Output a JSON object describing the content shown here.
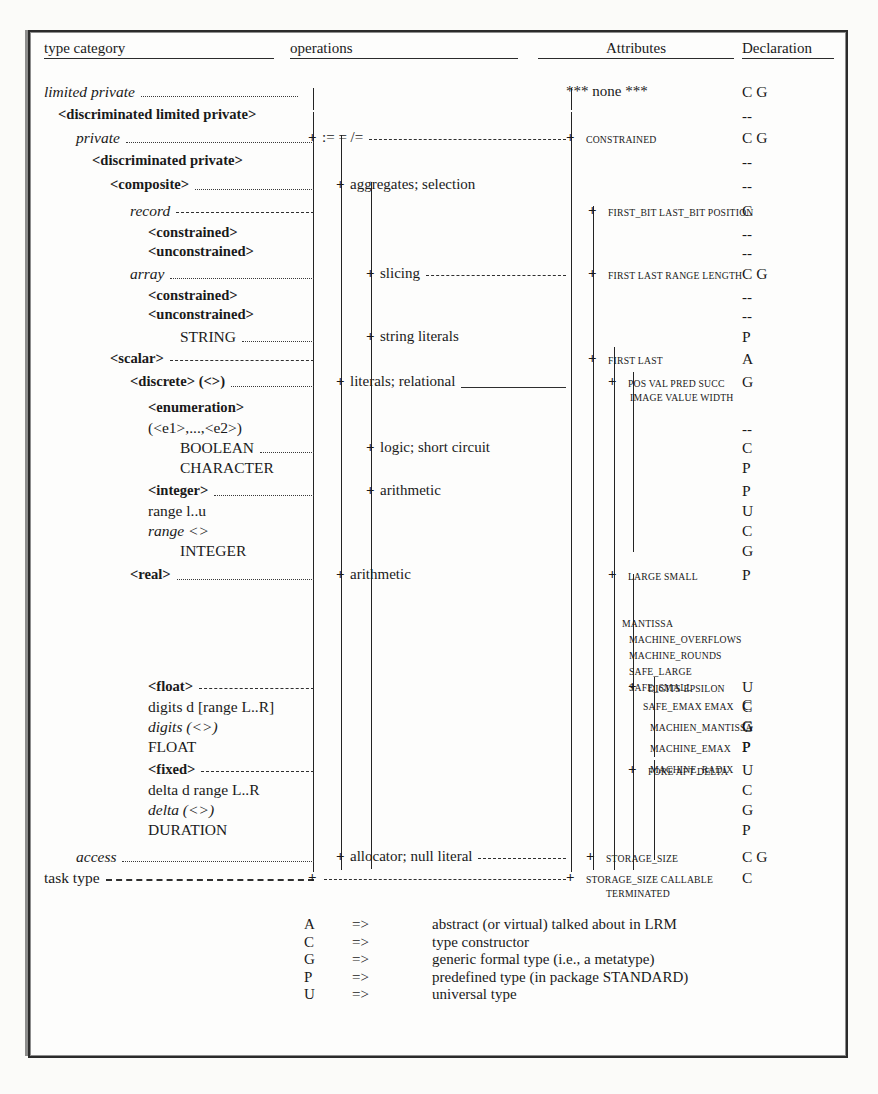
{
  "headers": {
    "type_category": "type category",
    "operations": "operations",
    "attributes": "Attributes",
    "declaration": "Declaration"
  },
  "rows": [
    {
      "category": "limited private",
      "style": "italic",
      "indent": 0,
      "leader": "dotted",
      "ops": "<basic operations>",
      "ops_plus": false,
      "attr": "*** none ***",
      "attr_plus": false,
      "attr_caps": false,
      "decl": "C G"
    },
    {
      "category": "<discriminated limited private>",
      "style": "bold",
      "indent": 1,
      "leader": "none",
      "ops": "",
      "ops_plus": false,
      "attr": "",
      "attr_plus": false,
      "decl": "--"
    },
    {
      "category": "private",
      "style": "italic",
      "indent": 2,
      "leader": "dotted",
      "ops": ":= = /=",
      "ops_plus": true,
      "ops_trail": "dashed",
      "attr": "CONSTRAINED",
      "attr_plus": true,
      "attr_caps": true,
      "decl": "C G"
    },
    {
      "category": "<discriminated private>",
      "style": "bold",
      "indent": 3,
      "leader": "none",
      "ops": "",
      "ops_plus": false,
      "attr": "",
      "attr_plus": false,
      "decl": "--"
    },
    {
      "category": "<composite>",
      "style": "bold",
      "indent": 4,
      "leader": "dotted",
      "ops": "aggregates; selection",
      "ops_plus": true,
      "attr": "",
      "attr_plus": false,
      "decl": "--"
    },
    {
      "category": "record",
      "style": "italic",
      "indent": 5,
      "leader": "dashed",
      "ops": "",
      "ops_plus": false,
      "ops_trail": "dashed",
      "attr": "FIRST_BIT LAST_BIT POSITION",
      "attr_plus": true,
      "attr_caps": true,
      "decl": "C"
    },
    {
      "category": "<constrained>",
      "style": "bold",
      "indent": 6,
      "leader": "none",
      "ops": "",
      "ops_plus": false,
      "attr": "",
      "attr_plus": false,
      "decl": "--"
    },
    {
      "category": "<unconstrained>",
      "style": "bold",
      "indent": 6,
      "leader": "none",
      "ops": "",
      "ops_plus": false,
      "attr": "",
      "attr_plus": false,
      "decl": "--"
    },
    {
      "category": "array",
      "style": "italic",
      "indent": 5,
      "leader": "dotted",
      "ops": "slicing",
      "ops_plus": true,
      "ops_trail": "dashed",
      "attr": "FIRST LAST RANGE LENGTH",
      "attr_plus": true,
      "attr_caps": true,
      "decl": "C G"
    },
    {
      "category": "<constrained>",
      "style": "bold",
      "indent": 6,
      "leader": "none",
      "ops": "",
      "ops_plus": false,
      "attr": "",
      "attr_plus": false,
      "decl": "--"
    },
    {
      "category": "<unconstrained>",
      "style": "bold",
      "indent": 6,
      "leader": "none",
      "ops": "",
      "ops_plus": false,
      "attr": "",
      "attr_plus": false,
      "decl": "--"
    },
    {
      "category": "STRING",
      "style": "plain",
      "indent": 7,
      "leader": "dotted",
      "ops": "string literals",
      "ops_plus": true,
      "attr": "",
      "attr_plus": false,
      "decl": "P"
    },
    {
      "category": "<scalar>",
      "style": "bold",
      "indent": 4,
      "leader": "dashed",
      "ops": "",
      "ops_plus": false,
      "ops_trail": "dashed",
      "attr": "FIRST LAST",
      "attr_plus": true,
      "attr_caps": true,
      "decl": "A"
    },
    {
      "category": "<discrete> (<>)",
      "style": "bold-ital",
      "indent": 5,
      "leader": "dotted",
      "ops": "literals; relational",
      "ops_plus": true,
      "ops_trail": "solid",
      "attr": "POS   VAL PRED SUCC",
      "attr_plus": true,
      "attr_caps": true,
      "attr2": "IMAGE VALUE    WIDTH",
      "decl": "G"
    },
    {
      "category": "<enumeration>",
      "style": "bold",
      "indent": 6,
      "leader": "none",
      "ops": "",
      "ops_plus": false,
      "attr": "",
      "attr_plus": false,
      "decl": ""
    },
    {
      "category": "(<e1>,...,<e2>)",
      "style": "plain",
      "indent": 6,
      "leader": "none",
      "ops": "",
      "ops_plus": false,
      "attr": "",
      "attr_plus": false,
      "decl": "--"
    },
    {
      "category": "BOOLEAN",
      "style": "plain",
      "indent": 7,
      "leader": "dotted",
      "ops": "logic; short circuit",
      "ops_plus": true,
      "attr": "",
      "attr_plus": false,
      "decl": "C"
    },
    {
      "category": "CHARACTER",
      "style": "plain",
      "indent": 7,
      "leader": "none",
      "ops": "",
      "ops_plus": false,
      "attr": "",
      "attr_plus": false,
      "decl": "P"
    },
    {
      "category": "<integer>",
      "style": "bold",
      "indent": 6,
      "leader": "dotted",
      "ops": "arithmetic",
      "ops_plus": true,
      "attr": "",
      "attr_plus": false,
      "decl": "P"
    },
    {
      "category": "range l..u",
      "style": "plain",
      "indent": 6,
      "leader": "none",
      "ops": "",
      "ops_plus": false,
      "attr": "",
      "attr_plus": false,
      "decl": "U"
    },
    {
      "category": "range <>",
      "style": "italic",
      "indent": 6,
      "leader": "none",
      "ops": "",
      "ops_plus": false,
      "attr": "",
      "attr_plus": false,
      "decl": "C"
    },
    {
      "category": "INTEGER",
      "style": "plain",
      "indent": 7,
      "leader": "none",
      "ops": "",
      "ops_plus": false,
      "attr": "",
      "attr_plus": false,
      "decl": "G"
    },
    {
      "category": "<real>",
      "style": "bold",
      "indent": 5,
      "leader": "dotted",
      "ops": "arithmetic",
      "ops_plus": true,
      "attr": "LARGE SMALL",
      "attr_plus": true,
      "attr_caps": true,
      "decl": "P"
    },
    {
      "category": "<float>",
      "style": "bold",
      "indent": 6,
      "leader": "dashed",
      "ops": "",
      "ops_plus": false,
      "ops_trail": "dashed",
      "attr": "DIGITS EPSILON",
      "attr_plus": true,
      "attr_caps": true,
      "decl": "U"
    },
    {
      "category": "digits d [range L..R]",
      "style": "plain",
      "indent": 6,
      "leader": "none",
      "ops": "",
      "ops_plus": false,
      "attr": "",
      "attr_plus": false,
      "decl": "C"
    },
    {
      "category": "digits (<>)",
      "style": "italic",
      "indent": 6,
      "leader": "none",
      "ops": "",
      "ops_plus": false,
      "attr": "",
      "attr_plus": false,
      "decl": "G"
    },
    {
      "category": "FLOAT",
      "style": "plain",
      "indent": 6,
      "leader": "none",
      "ops": "",
      "ops_plus": false,
      "attr": "",
      "attr_plus": false,
      "decl": "P"
    },
    {
      "category": "<fixed>",
      "style": "bold",
      "indent": 6,
      "leader": "dashed",
      "ops": "",
      "ops_plus": false,
      "ops_trail": "dashed",
      "attr": "FORE AFT DELTA",
      "attr_plus": true,
      "attr_caps": true,
      "decl": "U"
    },
    {
      "category": "delta d range L..R",
      "style": "plain",
      "indent": 6,
      "leader": "none",
      "ops": "",
      "ops_plus": false,
      "attr": "",
      "attr_plus": false,
      "decl": "C"
    },
    {
      "category": "delta (<>)",
      "style": "italic",
      "indent": 6,
      "leader": "none",
      "ops": "",
      "ops_plus": false,
      "attr": "",
      "attr_plus": false,
      "decl": "G"
    },
    {
      "category": "DURATION",
      "style": "plain",
      "indent": 6,
      "leader": "none",
      "ops": "",
      "ops_plus": false,
      "attr": "",
      "attr_plus": false,
      "decl": "P"
    },
    {
      "category": "access",
      "style": "italic",
      "indent": 2,
      "leader": "dotted",
      "ops": "allocator; null literal",
      "ops_plus": true,
      "ops_trail": "dashed",
      "attr": "STORAGE_SIZE",
      "attr_plus": true,
      "attr_caps": true,
      "decl": "C G"
    },
    {
      "category": "task type",
      "style": "plain",
      "indent": 0,
      "leader": "dashed-heavy",
      "ops": "",
      "ops_plus": true,
      "ops_trail": "dashed",
      "attr": "STORAGE_SIZE CALLABLE",
      "attr_plus": true,
      "attr_caps": true,
      "attr2": "TERMINATED",
      "decl": "C"
    }
  ],
  "real_attr_extra": [
    "MANTISSA",
    "MACHINE_OVERFLOWS",
    "MACHINE_ROUNDS",
    "SAFE_LARGE",
    "SAFE_SMALL"
  ],
  "float_attr_extra": [
    "SAFE_EMAX EMAX",
    "MACHIEN_MANTISSA",
    "MACHINE_EMAX",
    "MACHINE_RADIX"
  ],
  "float_extra_decl": [
    "C",
    "G",
    "P"
  ],
  "legend": {
    "arrow": "=>",
    "entries": [
      {
        "key": "A",
        "text": "abstract (or virtual) talked about in LRM"
      },
      {
        "key": "C",
        "text": "type constructor"
      },
      {
        "key": "G",
        "text": "generic formal type (i.e., a metatype)"
      },
      {
        "key": "P",
        "text": "predefined type (in package STANDARD)"
      },
      {
        "key": "U",
        "text": "universal type"
      }
    ]
  }
}
